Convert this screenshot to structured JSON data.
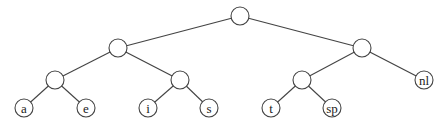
{
  "diagram": {
    "type": "binary-tree",
    "nodes": [
      {
        "id": "root",
        "label": "",
        "x": 240,
        "y": 16
      },
      {
        "id": "n1",
        "label": "",
        "x": 118,
        "y": 48
      },
      {
        "id": "n2",
        "label": "",
        "x": 362,
        "y": 48
      },
      {
        "id": "n3",
        "label": "",
        "x": 55,
        "y": 80
      },
      {
        "id": "n4",
        "label": "",
        "x": 180,
        "y": 80
      },
      {
        "id": "n5",
        "label": "",
        "x": 302,
        "y": 80
      },
      {
        "id": "nl",
        "label": "nl",
        "x": 424,
        "y": 80
      },
      {
        "id": "a",
        "label": "a",
        "x": 24,
        "y": 108
      },
      {
        "id": "e",
        "label": "e",
        "x": 86,
        "y": 108
      },
      {
        "id": "i",
        "label": "i",
        "x": 148,
        "y": 108
      },
      {
        "id": "s",
        "label": "s",
        "x": 209,
        "y": 108
      },
      {
        "id": "t",
        "label": "t",
        "x": 271,
        "y": 108
      },
      {
        "id": "sp",
        "label": "sp",
        "x": 332,
        "y": 108
      }
    ],
    "edges": [
      [
        "root",
        "n1"
      ],
      [
        "root",
        "n2"
      ],
      [
        "n1",
        "n3"
      ],
      [
        "n1",
        "n4"
      ],
      [
        "n2",
        "n5"
      ],
      [
        "n2",
        "nl"
      ],
      [
        "n3",
        "a"
      ],
      [
        "n3",
        "e"
      ],
      [
        "n4",
        "i"
      ],
      [
        "n4",
        "s"
      ],
      [
        "n5",
        "t"
      ],
      [
        "n5",
        "sp"
      ]
    ],
    "node_radius": 9
  }
}
